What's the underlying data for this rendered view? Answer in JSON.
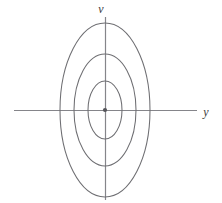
{
  "figure": {
    "kind": "phase-portrait-center",
    "width": 222,
    "height": 203,
    "background": "#ffffff",
    "line_color": "#6e6e72",
    "axis_color": "#85858a",
    "label_color": "#3b3b3b",
    "origin_dot_color": "#55555a"
  },
  "axes": {
    "horizontal": {
      "label": "y",
      "label_x": 206,
      "label_y": 116,
      "x_start": 14,
      "x_end": 197,
      "y": 110
    },
    "vertical": {
      "label": "v",
      "label_x": 101,
      "label_y": 13,
      "y_start": 17,
      "y_end": 200,
      "x": 105
    }
  },
  "origin": {
    "label": "origin",
    "cx": 105,
    "cy": 110,
    "r": 2.1
  },
  "chart_data": {
    "type": "scatter",
    "title": "",
    "xlabel": "y",
    "ylabel": "v",
    "curves": [
      {
        "name": "inner-orbit",
        "cx": 105,
        "cy": 110,
        "rx": 17,
        "ry": 29
      },
      {
        "name": "middle-orbit",
        "cx": 105,
        "cy": 110,
        "rx": 31,
        "ry": 56
      },
      {
        "name": "outer-orbit",
        "cx": 105,
        "cy": 110,
        "rx": 45,
        "ry": 87
      }
    ],
    "axis_crossings": {
      "horizontal_left": [
        88,
        74,
        60
      ],
      "horizontal_right": [
        122,
        136,
        150
      ],
      "vertical_top": [
        81,
        54,
        23
      ],
      "vertical_bottom": [
        139,
        166,
        197
      ]
    }
  }
}
